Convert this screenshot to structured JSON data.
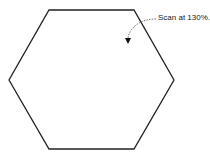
{
  "diagram": {
    "shape": "hexagon",
    "stroke_color": "#222222",
    "annotation": {
      "text": "Scan at 130%.",
      "arrow": "curved-dashed-arrow-pointing-down-left"
    }
  }
}
